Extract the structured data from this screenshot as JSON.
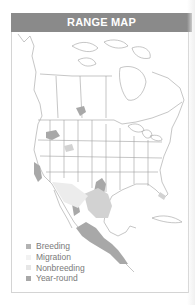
{
  "header": {
    "title": "RANGE MAP"
  },
  "legend": {
    "items": [
      {
        "label": "Breeding",
        "color": "#b3b3b3"
      },
      {
        "label": "Migration",
        "color": "#f2f2f2"
      },
      {
        "label": "Nonbreeding",
        "color": "#e6e6e6"
      },
      {
        "label": "Year-round",
        "color": "#a8a8a8"
      }
    ]
  },
  "colors": {
    "header_bg": "#8a8a8a",
    "land": "#ffffff",
    "outline": "#9a9a9a",
    "yearround": "#a8a8a8",
    "nonbreeding": "#e3e3e3",
    "breeding": "#b8b8b8"
  }
}
